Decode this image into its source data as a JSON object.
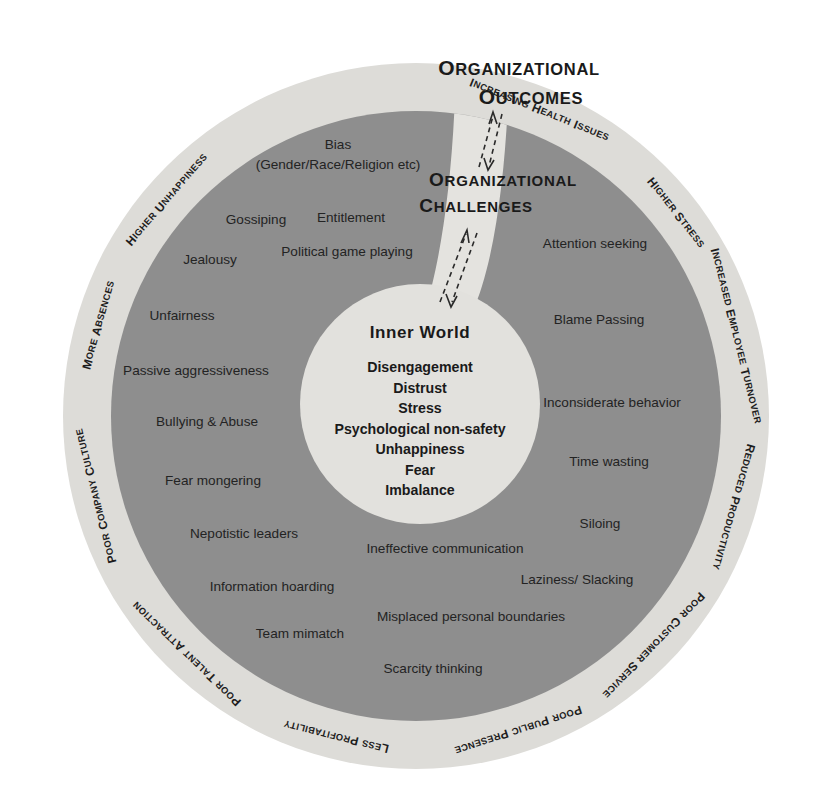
{
  "canvas": {
    "width": 828,
    "height": 807,
    "background": "#ffffff"
  },
  "colors": {
    "outer_ring": "#dddcd8",
    "middle_ring": "#8e8e8e",
    "core_circle": "#e2e1dd",
    "channel": "#e4e3df",
    "text": "#1d1d1d"
  },
  "headlines": [
    {
      "id": "organizational-outcomes",
      "line1": "Organizational",
      "line2": "Outcomes"
    },
    {
      "id": "organizational-challenges",
      "line1": "Organizational",
      "line2": "Challenges"
    }
  ],
  "outer_ring": {
    "name": "organizational-outcomes-ring",
    "labels": [
      {
        "text": "Increasing Health Issues",
        "angle": -68
      },
      {
        "text": "Higher Stress",
        "angle": -38
      },
      {
        "text": "Increased Employee Turnover",
        "angle": -14
      },
      {
        "text": "Reduced Productivity",
        "angle": 16
      },
      {
        "text": "Poor Customer Service",
        "angle": 44
      },
      {
        "text": "Poor Public Presence",
        "angle": 72
      },
      {
        "text": "Less Profitability",
        "angle": 104
      },
      {
        "text": "Poor Talent Attraction",
        "angle": 134
      },
      {
        "text": "Poor Company Culture",
        "angle": 166
      },
      {
        "text": "More Absences",
        "angle": 196
      },
      {
        "text": "Higher Unhappiness",
        "angle": 221
      }
    ]
  },
  "middle_ring": {
    "name": "organizational-challenges-ring",
    "labels": [
      {
        "text": "Bias",
        "x": 338,
        "y": 149,
        "anchor": "middle"
      },
      {
        "text": "(Gender/Race/Religion etc)",
        "x": 338,
        "y": 169,
        "anchor": "middle"
      },
      {
        "text": "Gossiping",
        "x": 256,
        "y": 224,
        "anchor": "middle"
      },
      {
        "text": "Entitlement",
        "x": 351,
        "y": 222,
        "anchor": "middle"
      },
      {
        "text": "Jealousy",
        "x": 210,
        "y": 264,
        "anchor": "middle"
      },
      {
        "text": "Political game playing",
        "x": 347,
        "y": 256,
        "anchor": "middle"
      },
      {
        "text": "Unfairness",
        "x": 182,
        "y": 320,
        "anchor": "middle"
      },
      {
        "text": "Passive aggressiveness",
        "x": 196,
        "y": 375,
        "anchor": "middle"
      },
      {
        "text": "Bullying & Abuse",
        "x": 207,
        "y": 426,
        "anchor": "middle"
      },
      {
        "text": "Fear mongering",
        "x": 213,
        "y": 485,
        "anchor": "middle"
      },
      {
        "text": "Nepotistic leaders",
        "x": 244,
        "y": 538,
        "anchor": "middle"
      },
      {
        "text": "Information hoarding",
        "x": 272,
        "y": 591,
        "anchor": "middle"
      },
      {
        "text": "Team mimatch",
        "x": 300,
        "y": 638,
        "anchor": "middle"
      },
      {
        "text": "Scarcity thinking",
        "x": 433,
        "y": 673,
        "anchor": "middle"
      },
      {
        "text": "Misplaced personal boundaries",
        "x": 471,
        "y": 621,
        "anchor": "middle"
      },
      {
        "text": "Ineffective communication",
        "x": 445,
        "y": 553,
        "anchor": "middle"
      },
      {
        "text": "Laziness/ Slacking",
        "x": 577,
        "y": 584,
        "anchor": "middle"
      },
      {
        "text": "Siloing",
        "x": 600,
        "y": 528,
        "anchor": "middle"
      },
      {
        "text": "Time wasting",
        "x": 609,
        "y": 466,
        "anchor": "middle"
      },
      {
        "text": "Inconsiderate behavior",
        "x": 612,
        "y": 407,
        "anchor": "middle"
      },
      {
        "text": "Blame Passing",
        "x": 599,
        "y": 324,
        "anchor": "middle"
      },
      {
        "text": "Attention seeking",
        "x": 595,
        "y": 248,
        "anchor": "middle"
      }
    ]
  },
  "core": {
    "name": "inner-world-core",
    "title": "Inner World",
    "items": [
      "Disengagement",
      "Distrust",
      "Stress",
      "Psychological non-safety",
      "Unhappiness",
      "Fear",
      "Imbalance"
    ]
  },
  "connectors": [
    {
      "id": "challenges-to-outcomes",
      "direction": "bidirectional"
    },
    {
      "id": "inner-world-to-challenges",
      "direction": "bidirectional"
    }
  ]
}
